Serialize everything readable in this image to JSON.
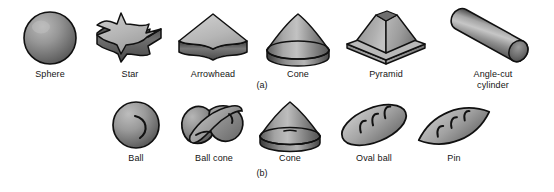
{
  "figure": {
    "background_color": "#ffffff",
    "outline_color": "#101010",
    "label_color": "#141414",
    "rows": [
      {
        "panel_label": "(a)",
        "items": [
          {
            "id": "sphere",
            "label": "Sphere",
            "icon": "sphere-shape-icon"
          },
          {
            "id": "star",
            "label": "Star",
            "icon": "star-prism-shape-icon"
          },
          {
            "id": "arrowhead",
            "label": "Arrowhead",
            "icon": "arrowhead-prism-shape-icon"
          },
          {
            "id": "cone",
            "label": "Cone",
            "icon": "cone-shape-icon"
          },
          {
            "id": "pyramid",
            "label": "Pyramid",
            "icon": "pyramid-shape-icon"
          },
          {
            "id": "angle-cut-cylinder",
            "label": "Angle-cut\ncylinder",
            "icon": "angle-cut-cylinder-shape-icon"
          }
        ]
      },
      {
        "panel_label": "(b)",
        "items": [
          {
            "id": "ball",
            "label": "Ball",
            "icon": "ball-shape-icon"
          },
          {
            "id": "ball-cone",
            "label": "Ball cone",
            "icon": "ball-cone-shape-icon"
          },
          {
            "id": "cone-b",
            "label": "Cone",
            "icon": "cone-shape-icon"
          },
          {
            "id": "oval-ball",
            "label": "Oval ball",
            "icon": "oval-ball-shape-icon"
          },
          {
            "id": "pin",
            "label": "Pin",
            "icon": "pin-shape-icon"
          }
        ]
      }
    ]
  }
}
